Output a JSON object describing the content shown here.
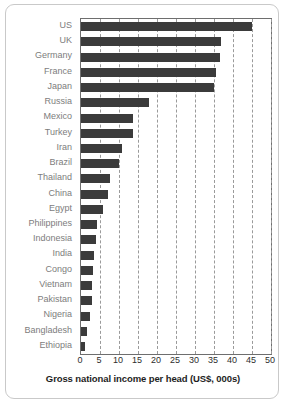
{
  "chart_data": {
    "type": "bar",
    "orientation": "horizontal",
    "title": "",
    "subtitle": "",
    "xlabel": "Gross national income per head (US$, 000s)",
    "ylabel": "",
    "xlim": [
      0,
      50
    ],
    "xticks": [
      0,
      5,
      10,
      15,
      20,
      25,
      30,
      35,
      40,
      45,
      50
    ],
    "xtick_labels": [
      "0",
      "5",
      "10",
      "15",
      "20",
      "25",
      "30",
      "35",
      "40",
      "45",
      "50"
    ],
    "grid": "vertical-dashed",
    "legend": "none",
    "bar_color": "#3b3b3b",
    "categories": [
      "US",
      "UK",
      "Germany",
      "France",
      "Japan",
      "Russia",
      "Mexico",
      "Turkey",
      "Iran",
      "Brazil",
      "Thailand",
      "China",
      "Egypt",
      "Philippines",
      "Indonesia",
      "India",
      "Congo",
      "Vietnam",
      "Pakistan",
      "Nigeria",
      "Bangladesh",
      "Ethiopia"
    ],
    "values": [
      45.0,
      36.8,
      36.5,
      35.5,
      35.0,
      18.0,
      13.7,
      13.6,
      10.8,
      10.0,
      7.5,
      7.0,
      5.8,
      4.2,
      3.9,
      3.3,
      3.1,
      3.0,
      2.8,
      2.3,
      1.5,
      1.1
    ],
    "series": [
      {
        "name": "Gross national income per head",
        "values": [
          45.0,
          36.8,
          36.5,
          35.5,
          35.0,
          18.0,
          13.7,
          13.6,
          10.8,
          10.0,
          7.5,
          7.0,
          5.8,
          4.2,
          3.9,
          3.3,
          3.1,
          3.0,
          2.8,
          2.3,
          1.5,
          1.1
        ]
      }
    ]
  }
}
